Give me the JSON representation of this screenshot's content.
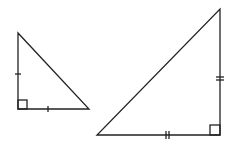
{
  "diagram": {
    "stroke_color": "#222222",
    "background": "#ffffff",
    "triangles": [
      {
        "name": "small-triangle",
        "vertices": {
          "top": [
            18,
            33
          ],
          "right_angle": [
            18,
            109
          ],
          "right": [
            89,
            109
          ]
        },
        "leg_tick_count": 1,
        "right_angle_marker": true
      },
      {
        "name": "large-triangle",
        "vertices": {
          "top": [
            220,
            9
          ],
          "right_angle": [
            220,
            135
          ],
          "left": [
            97,
            135
          ]
        },
        "leg_tick_count": 2,
        "right_angle_marker": true
      }
    ]
  }
}
